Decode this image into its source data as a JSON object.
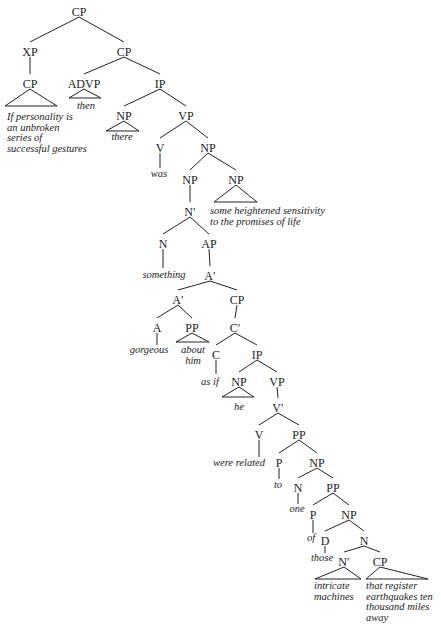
{
  "diagram": {
    "type": "syntax-tree",
    "nodes": [
      {
        "id": "n0",
        "label": "CP",
        "x": 79,
        "y": 12
      },
      {
        "id": "n1",
        "label": "XP",
        "x": 30,
        "y": 52
      },
      {
        "id": "n2",
        "label": "CP",
        "x": 124,
        "y": 52
      },
      {
        "id": "n3",
        "label": "CP",
        "x": 30,
        "y": 84
      },
      {
        "id": "n4",
        "label": "ADVP",
        "x": 84,
        "y": 84
      },
      {
        "id": "n5",
        "label": "IP",
        "x": 160,
        "y": 84
      },
      {
        "id": "n6",
        "label": "NP",
        "x": 124,
        "y": 116
      },
      {
        "id": "n7",
        "label": "VP",
        "x": 186,
        "y": 116
      },
      {
        "id": "n8",
        "label": "V",
        "x": 160,
        "y": 148
      },
      {
        "id": "n9",
        "label": "NP",
        "x": 208,
        "y": 148
      },
      {
        "id": "n10",
        "label": "NP",
        "x": 190,
        "y": 180
      },
      {
        "id": "n11",
        "label": "NP",
        "x": 236,
        "y": 180
      },
      {
        "id": "n12",
        "label": "N'",
        "x": 190,
        "y": 212
      },
      {
        "id": "n13",
        "label": "N",
        "x": 163,
        "y": 244
      },
      {
        "id": "n14",
        "label": "AP",
        "x": 209,
        "y": 244
      },
      {
        "id": "n15",
        "label": "A'",
        "x": 210,
        "y": 276
      },
      {
        "id": "n16",
        "label": "A'",
        "x": 178,
        "y": 300
      },
      {
        "id": "n17",
        "label": "CP",
        "x": 237,
        "y": 300
      },
      {
        "id": "n18",
        "label": "A",
        "x": 157,
        "y": 328
      },
      {
        "id": "n19",
        "label": "PP",
        "x": 192,
        "y": 328
      },
      {
        "id": "n20",
        "label": "C'",
        "x": 235,
        "y": 328
      },
      {
        "id": "n21",
        "label": "C",
        "x": 216,
        "y": 355
      },
      {
        "id": "n22",
        "label": "IP",
        "x": 257,
        "y": 355
      },
      {
        "id": "n23",
        "label": "NP",
        "x": 239,
        "y": 382
      },
      {
        "id": "n24",
        "label": "VP",
        "x": 277,
        "y": 382
      },
      {
        "id": "n25",
        "label": "V'",
        "x": 278,
        "y": 408
      },
      {
        "id": "n26",
        "label": "V",
        "x": 259,
        "y": 435
      },
      {
        "id": "n27",
        "label": "PP",
        "x": 299,
        "y": 435
      },
      {
        "id": "n28",
        "label": "P",
        "x": 279,
        "y": 463
      },
      {
        "id": "n29",
        "label": "NP",
        "x": 317,
        "y": 463
      },
      {
        "id": "n30",
        "label": "N",
        "x": 298,
        "y": 488
      },
      {
        "id": "n31",
        "label": "PP",
        "x": 333,
        "y": 488
      },
      {
        "id": "n32",
        "label": "P",
        "x": 313,
        "y": 515
      },
      {
        "id": "n33",
        "label": "NP",
        "x": 349,
        "y": 515
      },
      {
        "id": "n34",
        "label": "D",
        "x": 325,
        "y": 541
      },
      {
        "id": "n35",
        "label": "N",
        "x": 364,
        "y": 541
      },
      {
        "id": "n36",
        "label": "N'",
        "x": 344,
        "y": 562
      },
      {
        "id": "n37",
        "label": "CP",
        "x": 380,
        "y": 562
      }
    ],
    "edges": [
      [
        "n0",
        "n1"
      ],
      [
        "n0",
        "n2"
      ],
      [
        "n1",
        "n3"
      ],
      [
        "n2",
        "n4"
      ],
      [
        "n2",
        "n5"
      ],
      [
        "n5",
        "n6"
      ],
      [
        "n5",
        "n7"
      ],
      [
        "n7",
        "n8"
      ],
      [
        "n7",
        "n9"
      ],
      [
        "n9",
        "n10"
      ],
      [
        "n9",
        "n11"
      ],
      [
        "n10",
        "n12"
      ],
      [
        "n12",
        "n13"
      ],
      [
        "n12",
        "n14"
      ],
      [
        "n14",
        "n15"
      ],
      [
        "n15",
        "n16"
      ],
      [
        "n15",
        "n17"
      ],
      [
        "n16",
        "n18"
      ],
      [
        "n16",
        "n19"
      ],
      [
        "n17",
        "n20"
      ],
      [
        "n20",
        "n21"
      ],
      [
        "n20",
        "n22"
      ],
      [
        "n22",
        "n23"
      ],
      [
        "n22",
        "n24"
      ],
      [
        "n24",
        "n25"
      ],
      [
        "n25",
        "n26"
      ],
      [
        "n25",
        "n27"
      ],
      [
        "n27",
        "n28"
      ],
      [
        "n27",
        "n29"
      ],
      [
        "n29",
        "n30"
      ],
      [
        "n29",
        "n31"
      ],
      [
        "n31",
        "n32"
      ],
      [
        "n31",
        "n33"
      ],
      [
        "n33",
        "n34"
      ],
      [
        "n33",
        "n35"
      ],
      [
        "n35",
        "n36"
      ],
      [
        "n35",
        "n37"
      ]
    ],
    "triangles": [
      {
        "node": "n3",
        "left": 5,
        "right": 57,
        "base": 106
      },
      {
        "node": "n4",
        "left": 69,
        "right": 101,
        "base": 98
      },
      {
        "node": "n6",
        "left": 106,
        "right": 139,
        "base": 131
      },
      {
        "node": "n11",
        "left": 214,
        "right": 257,
        "base": 202
      },
      {
        "node": "n19",
        "left": 176,
        "right": 209,
        "base": 342
      },
      {
        "node": "n23",
        "left": 222,
        "right": 254,
        "base": 397
      },
      {
        "node": "n36",
        "left": 315,
        "right": 361,
        "base": 579
      },
      {
        "node": "n37",
        "left": 366,
        "right": 428,
        "base": 579
      }
    ],
    "stems": [
      {
        "node": "n8",
        "to_y": 168
      },
      {
        "node": "n13",
        "to_y": 268
      },
      {
        "node": "n18",
        "to_y": 345
      },
      {
        "node": "n21",
        "to_y": 374
      },
      {
        "node": "n26",
        "to_y": 457
      },
      {
        "node": "n28",
        "to_y": 479
      },
      {
        "node": "n30",
        "to_y": 504
      },
      {
        "node": "n32",
        "to_y": 533
      },
      {
        "node": "n34",
        "to_y": 553
      }
    ],
    "leaves": [
      {
        "node": "n3",
        "x": 7,
        "y": 120,
        "anchor": "start",
        "lines": [
          "If personality is",
          "an unbroken",
          "series of",
          "successful gestures"
        ]
      },
      {
        "node": "n4",
        "x": 86,
        "y": 109,
        "anchor": "middle",
        "lines": [
          "then"
        ]
      },
      {
        "node": "n6",
        "x": 122,
        "y": 140,
        "anchor": "middle",
        "lines": [
          "there"
        ]
      },
      {
        "node": "n8",
        "x": 159,
        "y": 177,
        "anchor": "middle",
        "lines": [
          "was"
        ]
      },
      {
        "node": "n11",
        "x": 210,
        "y": 214,
        "anchor": "start",
        "lines": [
          "some heightened sensitivity",
          "to the promises of life"
        ]
      },
      {
        "node": "n13",
        "x": 164,
        "y": 278,
        "anchor": "middle",
        "lines": [
          "something"
        ]
      },
      {
        "node": "n18",
        "x": 149,
        "y": 353,
        "anchor": "middle",
        "lines": [
          "gorgeous"
        ]
      },
      {
        "node": "n19",
        "x": 193,
        "y": 353,
        "anchor": "middle",
        "lines": [
          "about",
          "him"
        ]
      },
      {
        "node": "n21",
        "x": 210,
        "y": 385,
        "anchor": "middle",
        "lines": [
          "as if"
        ]
      },
      {
        "node": "n23",
        "x": 239,
        "y": 410,
        "anchor": "middle",
        "lines": [
          "he"
        ]
      },
      {
        "node": "n26",
        "x": 239,
        "y": 466,
        "anchor": "middle",
        "lines": [
          "were related"
        ]
      },
      {
        "node": "n28",
        "x": 278,
        "y": 488,
        "anchor": "middle",
        "lines": [
          "to"
        ]
      },
      {
        "node": "n30",
        "x": 297,
        "y": 512,
        "anchor": "middle",
        "lines": [
          "one"
        ]
      },
      {
        "node": "n32",
        "x": 311,
        "y": 541,
        "anchor": "middle",
        "lines": [
          "of"
        ]
      },
      {
        "node": "n34",
        "x": 322,
        "y": 561,
        "anchor": "middle",
        "lines": [
          "those"
        ]
      },
      {
        "node": "n36",
        "x": 314,
        "y": 589,
        "anchor": "start",
        "lines": [
          "intricate",
          "machines"
        ]
      },
      {
        "node": "n37",
        "x": 366,
        "y": 589,
        "anchor": "start",
        "lines": [
          "that register",
          "earthquakes ten",
          "thousand miles",
          "away"
        ]
      }
    ]
  }
}
